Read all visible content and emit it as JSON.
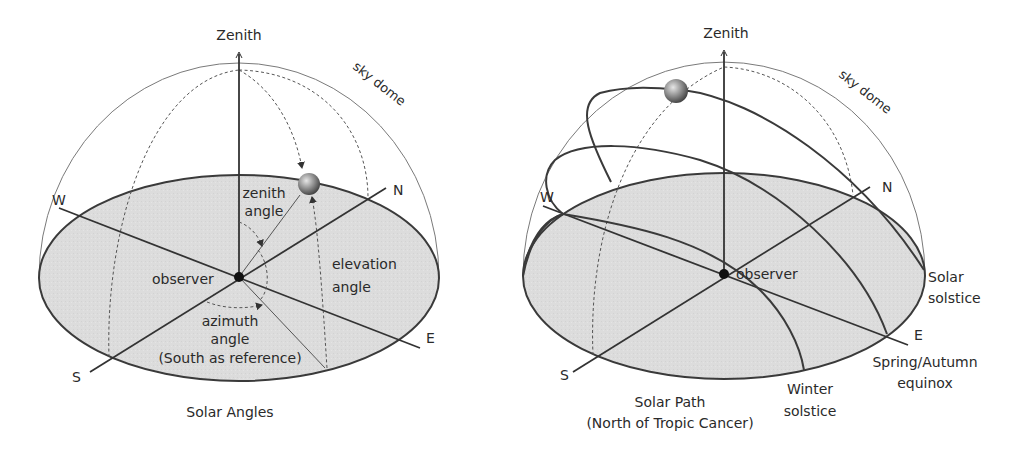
{
  "left_diagram": {
    "zenith": "Zenith",
    "sky_dome": "sky dome",
    "directions": {
      "w": "W",
      "n": "N",
      "e": "E",
      "s": "S"
    },
    "observer": "observer",
    "zenith_angle": [
      "zenith",
      "angle"
    ],
    "elevation_angle": [
      "elevation",
      "angle"
    ],
    "azimuth_angle": [
      "azimuth",
      "angle",
      "(South as reference)"
    ],
    "caption": "Solar Angles"
  },
  "right_diagram": {
    "zenith": "Zenith",
    "sky_dome": "sky dome",
    "directions": {
      "w": "W",
      "n": "N",
      "e": "E",
      "s": "S"
    },
    "observer": "observer",
    "solar_solstice": [
      "Solar",
      "solstice"
    ],
    "equinox": [
      "Spring/Autumn",
      "equinox"
    ],
    "winter_solstice": [
      "Winter",
      "solstice"
    ],
    "caption": [
      "Solar Path",
      "(North of Tropic Cancer)"
    ]
  },
  "colors": {
    "ground": "#dcdcdc",
    "outline": "#3a3a3a",
    "text": "#2a2a2a"
  }
}
